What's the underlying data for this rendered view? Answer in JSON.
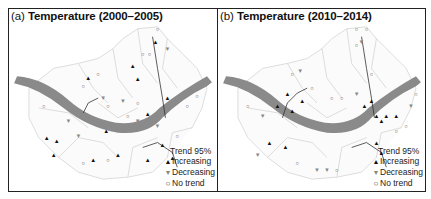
{
  "panels": [
    {
      "id": "a",
      "tag": "(a)",
      "title": "Temperature (2000–2005)",
      "legend": {
        "header": "Trend 95%",
        "items": [
          {
            "symbol": "▲",
            "label": "Increasing"
          },
          {
            "symbol": "▼",
            "label": "Decreasing"
          },
          {
            "symbol": "○",
            "label": "No trend"
          }
        ]
      }
    },
    {
      "id": "b",
      "tag": "(b)",
      "title": "Temperature (2010–2014)",
      "legend": {
        "header": "Trend 95%",
        "items": [
          {
            "symbol": "▲",
            "label": "Increasing"
          },
          {
            "symbol": "▼",
            "label": "Decreasing"
          },
          {
            "symbol": "○",
            "label": "No trend"
          }
        ]
      }
    }
  ],
  "colors": {
    "river": "#8a8a8a",
    "boundary": "#d4d4d4",
    "stream": "#333333",
    "increasing": "#111111",
    "decreasing": "#888888",
    "no_trend": "#444444"
  }
}
